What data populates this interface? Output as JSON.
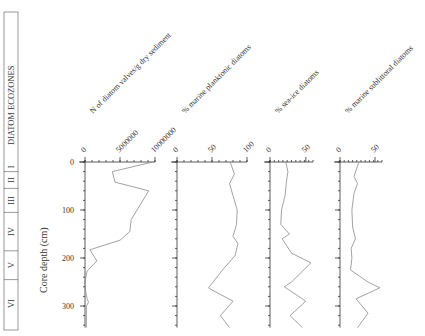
{
  "chart_data": {
    "type": "line",
    "title": "",
    "ylabel": "Core depth (cm)",
    "ylim": [
      0,
      345
    ],
    "y_ticks": [
      0,
      100,
      200,
      300
    ],
    "y_inverted": true,
    "grid": false,
    "ecozones": {
      "label": "DIATOM ECOZONES",
      "zones": [
        {
          "name": "I",
          "top": 0,
          "bottom": 20
        },
        {
          "name": "II",
          "top": 20,
          "bottom": 55
        },
        {
          "name": "III",
          "top": 55,
          "bottom": 105
        },
        {
          "name": "IV",
          "top": 105,
          "bottom": 185
        },
        {
          "name": "V",
          "top": 185,
          "bottom": 245
        },
        {
          "name": "VI",
          "top": 245,
          "bottom": 345
        }
      ]
    },
    "series": [
      {
        "name": "N of diatom valves/g dry sediment",
        "xlim": [
          0,
          10000000
        ],
        "x_ticks": [
          0,
          5000000,
          10000000
        ],
        "depth": [
          0,
          20,
          42,
          60,
          120,
          145,
          163,
          183,
          206,
          227,
          250,
          270,
          285,
          292,
          300,
          345
        ],
        "values": [
          9700000,
          3900000,
          4300000,
          9100000,
          6600000,
          6400000,
          5000000,
          700000,
          1700000,
          300000,
          0,
          100000,
          300000,
          500000,
          200000,
          200000
        ]
      },
      {
        "name": "% marine planktonic diatoms",
        "xlim": [
          0,
          100
        ],
        "x_ticks": [
          0,
          50,
          100
        ],
        "depth": [
          0,
          25,
          45,
          70,
          100,
          130,
          155,
          170,
          195,
          225,
          262,
          265,
          290,
          320,
          345
        ],
        "values": [
          76,
          82,
          75,
          80,
          86,
          85,
          80,
          87,
          83,
          65,
          45,
          48,
          80,
          62,
          75
        ]
      },
      {
        "name": "% sea-ice diatoms",
        "xlim": [
          0,
          60
        ],
        "x_ticks": [
          0,
          50
        ],
        "depth": [
          0,
          20,
          40,
          70,
          100,
          130,
          150,
          160,
          190,
          210,
          250,
          260,
          290,
          320,
          345
        ],
        "values": [
          22,
          25,
          23,
          21,
          16,
          15,
          27,
          17,
          30,
          57,
          30,
          20,
          50,
          28,
          45
        ]
      },
      {
        "name": "% marine sublittoral diatoms",
        "xlim": [
          0,
          60
        ],
        "x_ticks": [
          0,
          50
        ],
        "depth": [
          0,
          30,
          45,
          65,
          100,
          135,
          160,
          180,
          200,
          225,
          250,
          262,
          285,
          315,
          345
        ],
        "values": [
          27,
          20,
          25,
          20,
          17,
          18,
          22,
          16,
          17,
          15,
          40,
          57,
          23,
          40,
          25
        ]
      }
    ]
  }
}
